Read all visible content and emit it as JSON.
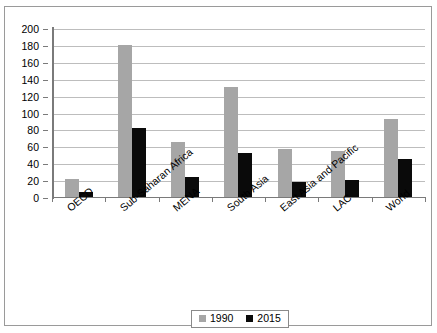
{
  "chart_data": {
    "type": "bar",
    "title": "",
    "subtitle": "",
    "xlabel": "",
    "ylabel": "",
    "ylim": [
      0,
      200
    ],
    "ytick_step": 20,
    "yticks": [
      0,
      20,
      40,
      60,
      80,
      100,
      120,
      140,
      160,
      180,
      200
    ],
    "grid": true,
    "legend_position": "bottom-center",
    "categories": [
      "OECD",
      "Sub-Saharan Africa",
      "MENA",
      "South Asia",
      "East Asia and Pacific",
      "LAC",
      "World"
    ],
    "series": [
      {
        "name": "1990",
        "color": "#a6a6a6",
        "values": [
          22,
          181,
          66,
          131,
          58,
          56,
          94
        ]
      },
      {
        "name": "2015",
        "color": "#0a0a0a",
        "values": [
          7,
          83,
          25,
          53,
          19,
          21,
          46
        ]
      }
    ]
  },
  "legend": {
    "items": [
      {
        "label": "1990",
        "swatch": "gray-swatch"
      },
      {
        "label": "2015",
        "swatch": "black-swatch"
      }
    ]
  }
}
